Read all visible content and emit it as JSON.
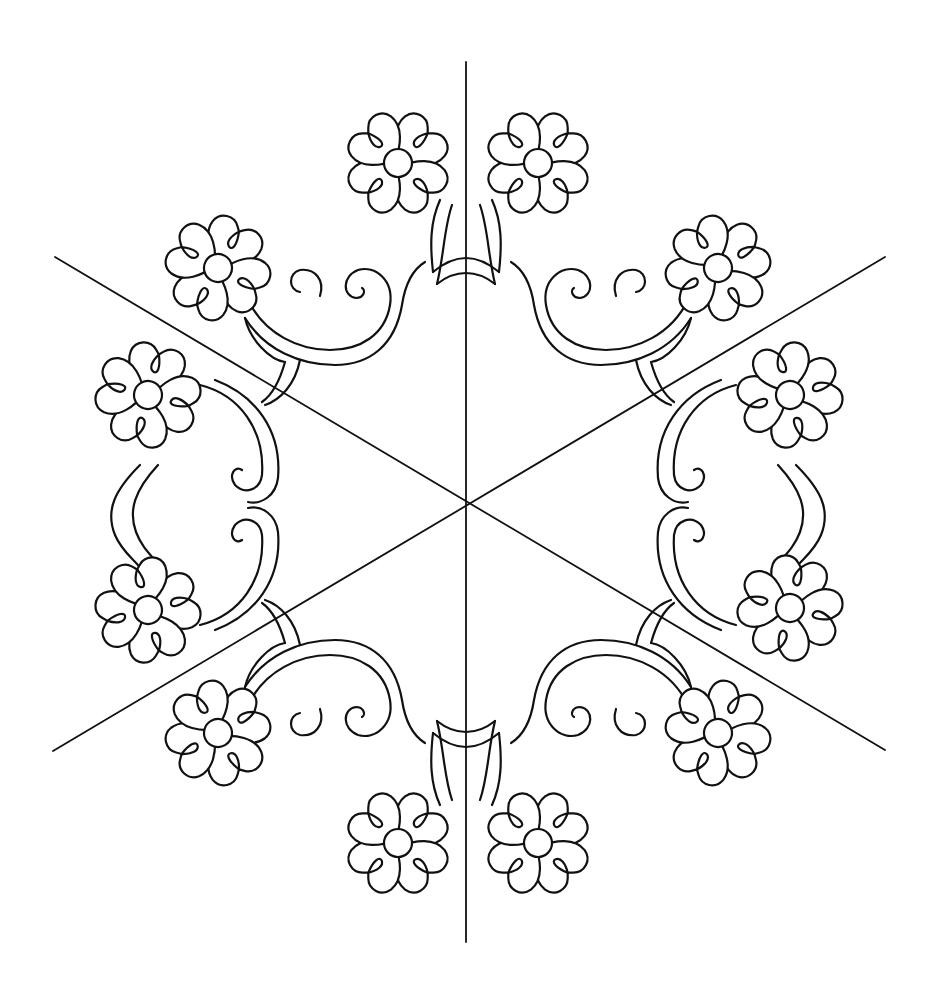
{
  "pattern": {
    "title": "",
    "type": "hexagonal floral wreath quilting pattern",
    "colors": {
      "ink": "#111111",
      "background": "#ffffff"
    },
    "center": [
      466,
      503
    ],
    "guide_lines": [
      {
        "name": "vertical-guide",
        "x1": 466,
        "y1": 62,
        "x2": 466,
        "y2": 942
      },
      {
        "name": "diagonal-guide-down",
        "x1": 55,
        "y1": 257,
        "x2": 885,
        "y2": 750
      },
      {
        "name": "diagonal-guide-up",
        "x1": 53,
        "y1": 751,
        "x2": 885,
        "y2": 257
      }
    ],
    "flowers": [
      {
        "cx": 398,
        "cy": 163,
        "rot": 0
      },
      {
        "cx": 538,
        "cy": 163,
        "rot": 0
      },
      {
        "cx": 218,
        "cy": 268,
        "rot": -15
      },
      {
        "cx": 718,
        "cy": 268,
        "rot": 15
      },
      {
        "cx": 148,
        "cy": 395,
        "rot": -30
      },
      {
        "cx": 790,
        "cy": 395,
        "rot": 30
      },
      {
        "cx": 148,
        "cy": 610,
        "rot": 30
      },
      {
        "cx": 790,
        "cy": 608,
        "rot": -30
      },
      {
        "cx": 218,
        "cy": 733,
        "rot": 15
      },
      {
        "cx": 718,
        "cy": 733,
        "rot": -15
      },
      {
        "cx": 398,
        "cy": 843,
        "rot": 0
      },
      {
        "cx": 538,
        "cy": 843,
        "rot": 0
      }
    ],
    "flower_style": {
      "petals": 4,
      "petal_shape": "heart",
      "center_radius": 14,
      "petal_length": 48
    }
  }
}
